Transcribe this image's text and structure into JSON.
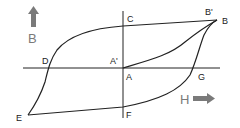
{
  "diagram": {
    "colors": {
      "background": "#ffffff",
      "curve": "#222222",
      "axis": "#222222",
      "arrow": "#7a7a7a"
    },
    "axes": {
      "vertical": {
        "label": "B",
        "arrow": "up-arrow"
      },
      "horizontal": {
        "label": "H",
        "arrow": "right-arrow"
      }
    },
    "points": {
      "A": "A",
      "A_prime": "A'",
      "B": "B",
      "B_prime": "B'",
      "C": "C",
      "D": "D",
      "E": "E",
      "F": "F",
      "G": "G"
    }
  }
}
